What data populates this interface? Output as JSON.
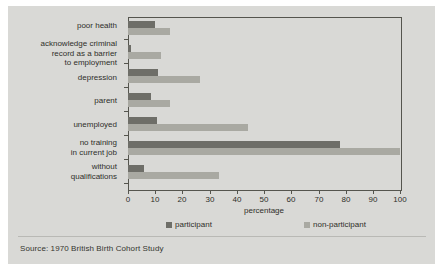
{
  "figure": {
    "source_note": "Source: 1970 British Birth Cohort Study"
  },
  "legend": {
    "participant_label": "participant",
    "nonparticipant_label": "non-participant"
  },
  "colors": {
    "participant": "#6e6e68",
    "nonparticipant": "#a9a9a2",
    "panel_background": "#d9d9d6",
    "axis": "#55554e",
    "text": "#2f2f2a"
  },
  "chart_data": {
    "type": "bar",
    "orientation": "horizontal",
    "title": "",
    "subtitle": "",
    "xlabel": "percentage",
    "ylabel": "",
    "xlim": [
      0,
      100
    ],
    "xticks": [
      0,
      10,
      20,
      30,
      40,
      50,
      60,
      70,
      80,
      90,
      100
    ],
    "xticklabels": [
      "0",
      "10",
      "20",
      "30",
      "40",
      "50",
      "60",
      "70",
      "80",
      "90",
      "100"
    ],
    "grid": false,
    "legend_position": "bottom",
    "categories": [
      "poor health",
      "acknowledge criminal\nrecord as a barrier\nto employment",
      "depression",
      "parent",
      "unemployed",
      "no training\nin current job",
      "without\nqualifications"
    ],
    "series": [
      {
        "name": "participant",
        "color": "#6e6e68",
        "values": [
          10,
          1,
          11,
          8.5,
          10.5,
          78,
          6
        ]
      },
      {
        "name": "non-participant",
        "color": "#a9a9a2",
        "values": [
          15.5,
          12,
          26.5,
          15.5,
          44,
          100,
          33.5
        ]
      }
    ],
    "annotations": [
      "Source: 1970 British Birth Cohort Study"
    ]
  }
}
